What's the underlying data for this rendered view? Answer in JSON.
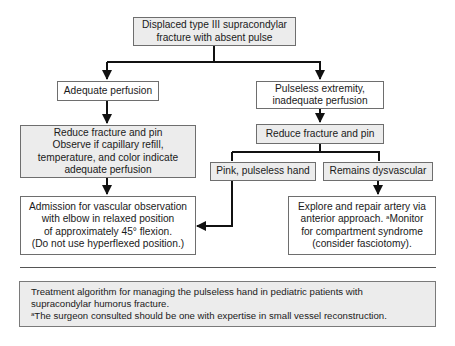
{
  "flowchart": {
    "root": {
      "lines": [
        "Displaced type III supracondylar",
        "fracture with absent pulse"
      ]
    },
    "left_branch": {
      "condition": {
        "lines": [
          "Adequate perfusion"
        ]
      },
      "action": {
        "lines": [
          "Reduce fracture and pin",
          "Observe if capillary refill,",
          "temperature, and color indicate",
          "adequate perfusion"
        ]
      },
      "outcome": {
        "lines": [
          "Admission for vascular observation",
          "with elbow in relaxed position",
          "of approximately 45° flexion.",
          "(Do not use hyperflexed position.)"
        ]
      }
    },
    "right_branch": {
      "condition": {
        "lines": [
          "Pulseless extremity,",
          "inadequate perfusion"
        ]
      },
      "action": {
        "lines": [
          "Reduce fracture and pin"
        ]
      },
      "sub_left": {
        "lines": [
          "Pink, pulseless hand"
        ]
      },
      "sub_right": {
        "lines": [
          "Remains dysvascular"
        ]
      },
      "outcome": {
        "lines": [
          "Explore and repair artery via",
          "anterior approach.",
          "Monitor",
          "for compartment syndrome",
          "(consider fasciotomy)."
        ],
        "footnote_marker": "a"
      }
    }
  },
  "caption": {
    "line1": "Treatment algorithm for managing the pulseless hand in pediatric patients with",
    "line2": "supracondylar humorus fracture.",
    "footnote_marker": "a",
    "line3": "The surgeon consulted should be one with expertise in small vessel reconstruction."
  },
  "colors": {
    "gray_box": "#ececec",
    "white_box": "#ffffff",
    "border": "#6e6e6e",
    "arrow": "#111111"
  }
}
